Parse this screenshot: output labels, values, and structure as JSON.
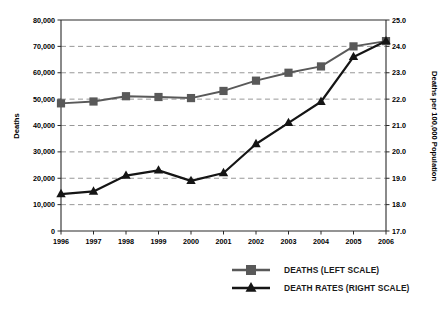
{
  "chart_data": {
    "type": "line",
    "title": "",
    "subtitle": "",
    "xlabel": "",
    "ylabel": "Deaths",
    "y2label": "Deaths per 100,000 Population",
    "grid": true,
    "legend_position": "bottom-right",
    "categories": [
      "1996",
      "1997",
      "1998",
      "1999",
      "2000",
      "2001",
      "2002",
      "2003",
      "2004",
      "2005",
      "2006"
    ],
    "x": [
      1996,
      1997,
      1998,
      1999,
      2000,
      2001,
      2002,
      2003,
      2004,
      2005,
      2006
    ],
    "ylim": [
      0,
      80000
    ],
    "y2lim": [
      17.0,
      25.0
    ],
    "yticks": [
      "0",
      "10,000",
      "20,000",
      "30,000",
      "40,000",
      "50,000",
      "60,000",
      "70,000",
      "80,000"
    ],
    "ytick_values": [
      0,
      10000,
      20000,
      30000,
      40000,
      50000,
      60000,
      70000,
      80000
    ],
    "y2ticks": [
      "17.0",
      "18.0",
      "19.0",
      "20.0",
      "21.0",
      "22.0",
      "23.0",
      "24.0",
      "25.0"
    ],
    "y2tick_values": [
      17.0,
      18.0,
      19.0,
      20.0,
      21.0,
      22.0,
      23.0,
      24.0,
      25.0
    ],
    "series": [
      {
        "name": "DEATHS (LEFT SCALE)",
        "axis": "left",
        "marker": "square",
        "color": "#595959",
        "values": [
          48400,
          49100,
          51100,
          50800,
          50400,
          53100,
          57000,
          60000,
          62400,
          70000,
          72000
        ]
      },
      {
        "name": "DEATH RATES (RIGHT SCALE)",
        "axis": "right",
        "marker": "triangle",
        "color": "#151515",
        "values": [
          18.4,
          18.5,
          19.1,
          19.3,
          18.9,
          19.2,
          20.3,
          21.1,
          21.9,
          23.6,
          24.2
        ]
      }
    ]
  },
  "legend": {
    "items": [
      {
        "label": "DEATHS (LEFT SCALE)",
        "marker": "square",
        "color": "#595959"
      },
      {
        "label": "DEATH RATES (RIGHT SCALE)",
        "marker": "triangle",
        "color": "#151515"
      }
    ]
  },
  "axes": {
    "left_title": "Deaths",
    "right_title": "Deaths per 100,000 Population"
  }
}
